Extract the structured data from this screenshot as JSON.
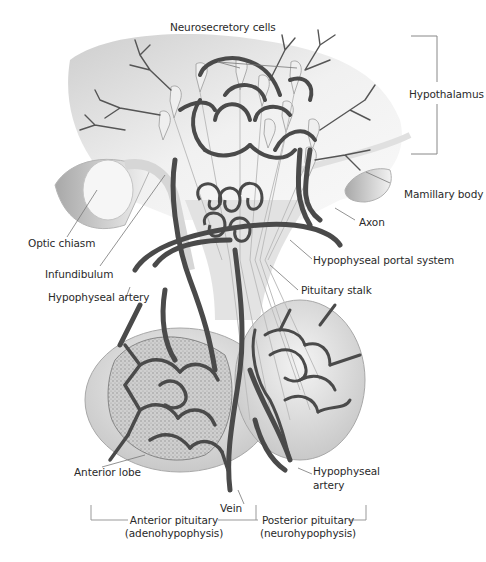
{
  "diagram": {
    "labels": {
      "neurosecretory_cells": "Neurosecretory cells",
      "hypothalamus": "Hypothalamus",
      "mamillary_body": "Mamillary body",
      "axon": "Axon",
      "optic_chiasm": "Optic chiasm",
      "infundibulum": "Infundibulum",
      "hypophyseal_portal_system": "Hypophyseal portal system",
      "hypophyseal_artery_upper": "Hypophyseal artery",
      "pituitary_stalk": "Pituitary stalk",
      "anterior_lobe": "Anterior lobe",
      "hypophyseal_artery_lower_1": "Hypophyseal",
      "hypophyseal_artery_lower_2": "artery",
      "vein": "Vein",
      "anterior_pituitary_1": "Anterior pituitary",
      "anterior_pituitary_2": "(adenohypophysis)",
      "posterior_pituitary_1": "Posterior pituitary",
      "posterior_pituitary_2": "(neurohypophysis)"
    },
    "colors": {
      "vessel": "#4a4a4a",
      "tissue": "#d9d9d9",
      "leader": "#777777",
      "text": "#2a2a2a"
    }
  }
}
